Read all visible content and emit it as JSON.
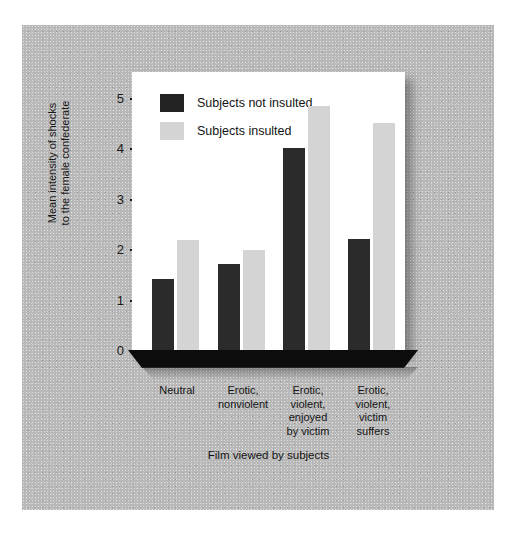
{
  "chart_data": {
    "type": "bar",
    "title": "",
    "xlabel": "Film viewed by subjects",
    "ylabel": "Mean intensity of shocks\nto the female confederate",
    "categories": [
      "Neutral",
      "Erotic,\nnonviolent",
      "Erotic,\nviolent,\nenjoyed\nby victim",
      "Erotic,\nviolent,\nvictim\nsuffers"
    ],
    "series": [
      {
        "name": "Subjects not insulted",
        "color": "#2b2b2b",
        "values": [
          1.4,
          1.7,
          4.0,
          2.2
        ]
      },
      {
        "name": "Subjects insulted",
        "color": "#d4d4d4",
        "values": [
          2.18,
          1.98,
          4.85,
          4.5
        ]
      }
    ],
    "ylim": [
      0,
      5
    ],
    "yticks": [
      0,
      1,
      2,
      3,
      4,
      5
    ],
    "ytick_labels": [
      "0",
      "1",
      "2",
      "3",
      "4",
      "5"
    ],
    "grid": false,
    "legend_position": "top-left"
  },
  "colors": {
    "bar_dark": "#2b2b2b",
    "bar_light": "#d4d4d4",
    "panel": "#ffffff",
    "background": "#b8b8b8",
    "base_slab": "#0c0c0c",
    "axis": "#1d1d1d"
  }
}
